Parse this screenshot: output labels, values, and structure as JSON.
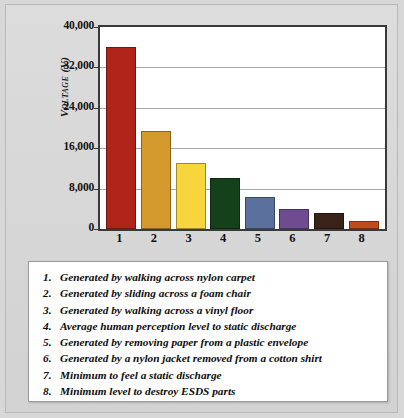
{
  "chart_data": {
    "type": "bar",
    "title": "",
    "xlabel": "",
    "ylabel": "Voltage (V)",
    "categories": [
      "1",
      "2",
      "3",
      "4",
      "5",
      "6",
      "7",
      "8"
    ],
    "values": [
      36000,
      19500,
      13000,
      10000,
      6300,
      4000,
      3200,
      1600
    ],
    "ylim": [
      0,
      40000
    ],
    "ytick_labels": [
      "0",
      "8,000",
      "16,000",
      "24,000",
      "32,000",
      "40,000"
    ],
    "ytick_values": [
      0,
      8000,
      16000,
      24000,
      32000,
      40000
    ],
    "grid": true,
    "legend_position": "below-plot",
    "bar_colors": [
      "#b0241a",
      "#d59a2e",
      "#f7d53c",
      "#14401a",
      "#5b709c",
      "#6f4c8f",
      "#3a2218",
      "#c04a1e"
    ],
    "series": [
      {
        "name": "Electrostatic voltage generated",
        "values": [
          36000,
          19500,
          13000,
          10000,
          6300,
          4000,
          3200,
          1600
        ]
      }
    ],
    "annotations": [
      "1. Generated by walking across nylon carpet",
      "2. Generated by sliding across a foam chair",
      "3. Generated by walking across a vinyl floor",
      "4. Average human perception level to static discharge",
      "5. Generated by removing paper from a plastic envelope",
      "6. Generated by a nylon jacket removed from a cotton shirt",
      "7. Minimum to feel a static discharge",
      "8. Minimum level to destroy ESDS parts"
    ]
  },
  "axis": {
    "y_title": "Voltage (V)",
    "y_ticks": [
      {
        "label": "40,000",
        "value": 40000
      },
      {
        "label": "32,000",
        "value": 32000
      },
      {
        "label": "24,000",
        "value": 24000
      },
      {
        "label": "16,000",
        "value": 16000
      },
      {
        "label": "8,000",
        "value": 8000
      },
      {
        "label": "0",
        "value": 0
      }
    ],
    "x_ticks": [
      "1",
      "2",
      "3",
      "4",
      "5",
      "6",
      "7",
      "8"
    ]
  },
  "bars": [
    {
      "category": "1",
      "value": 36000,
      "color": "#b0241a"
    },
    {
      "category": "2",
      "value": 19500,
      "color": "#d59a2e"
    },
    {
      "category": "3",
      "value": 13000,
      "color": "#f7d53c"
    },
    {
      "category": "4",
      "value": 10000,
      "color": "#14401a"
    },
    {
      "category": "5",
      "value": 6300,
      "color": "#5b709c"
    },
    {
      "category": "6",
      "value": 4000,
      "color": "#6f4c8f"
    },
    {
      "category": "7",
      "value": 3200,
      "color": "#3a2218"
    },
    {
      "category": "8",
      "value": 1600,
      "color": "#c04a1e"
    }
  ],
  "legend": {
    "items": [
      {
        "num": "1.",
        "text": "Generated by walking across nylon carpet"
      },
      {
        "num": "2.",
        "text": "Generated by sliding across a foam chair"
      },
      {
        "num": "3.",
        "text": "Generated by walking across a vinyl floor"
      },
      {
        "num": "4.",
        "text": "Average human perception level to static discharge"
      },
      {
        "num": "5.",
        "text": "Generated by removing paper from a plastic envelope"
      },
      {
        "num": "6.",
        "text": "Generated by a nylon jacket removed from a cotton shirt"
      },
      {
        "num": "7.",
        "text": "Minimum to feel a static discharge"
      },
      {
        "num": "8.",
        "text": "Minimum level to destroy ESDS parts"
      }
    ]
  },
  "colors": {
    "page_background": "#d7d7d7",
    "plot_background": "#ffffff",
    "plot_border": "#3a3a3a",
    "gridline": "#a8a8a8",
    "text": "#111111"
  }
}
